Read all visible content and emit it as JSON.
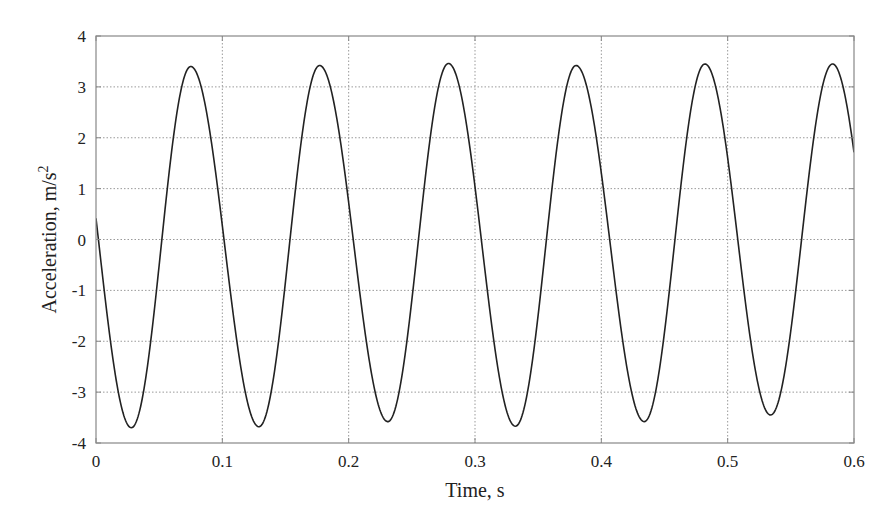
{
  "chart_data": {
    "type": "line",
    "title": "",
    "xlabel": "Time, s",
    "ylabel": "Acceleration, m/s",
    "ylabel_superscript": "2",
    "xlim": [
      0,
      0.6
    ],
    "ylim": [
      -4,
      4
    ],
    "xticks": [
      0,
      0.1,
      0.2,
      0.3,
      0.4,
      0.5,
      0.6
    ],
    "xtick_labels": [
      "0",
      "0.1",
      "0.2",
      "0.3",
      "0.4",
      "0.5",
      "0.6"
    ],
    "yticks": [
      -4,
      -3,
      -2,
      -1,
      0,
      1,
      2,
      3,
      4
    ],
    "ytick_labels": [
      "-4",
      "-3",
      "-2",
      "-1",
      "0",
      "1",
      "2",
      "3",
      "4"
    ],
    "grid": true,
    "grid_style": "dotted",
    "legend": null,
    "line_color": "#222222",
    "series": [
      {
        "name": "acceleration",
        "description": "quasi-sinusoidal oscillation, ~9.8 Hz",
        "start": {
          "x": 0.0,
          "y": 0.3
        },
        "end": {
          "x": 0.6,
          "y": 2.2
        },
        "extrema": [
          {
            "x": 0.028,
            "y": -3.7
          },
          {
            "x": 0.075,
            "y": 3.4
          },
          {
            "x": 0.129,
            "y": -3.68
          },
          {
            "x": 0.177,
            "y": 3.42
          },
          {
            "x": 0.231,
            "y": -3.58
          },
          {
            "x": 0.279,
            "y": 3.46
          },
          {
            "x": 0.332,
            "y": -3.67
          },
          {
            "x": 0.38,
            "y": 3.42
          },
          {
            "x": 0.434,
            "y": -3.58
          },
          {
            "x": 0.482,
            "y": 3.45
          },
          {
            "x": 0.534,
            "y": -3.45
          },
          {
            "x": 0.583,
            "y": 3.45
          }
        ]
      }
    ]
  },
  "axes": {
    "x_title": "Time, s",
    "y_title_main": "Acceleration, m/s",
    "y_title_sup": "2"
  }
}
